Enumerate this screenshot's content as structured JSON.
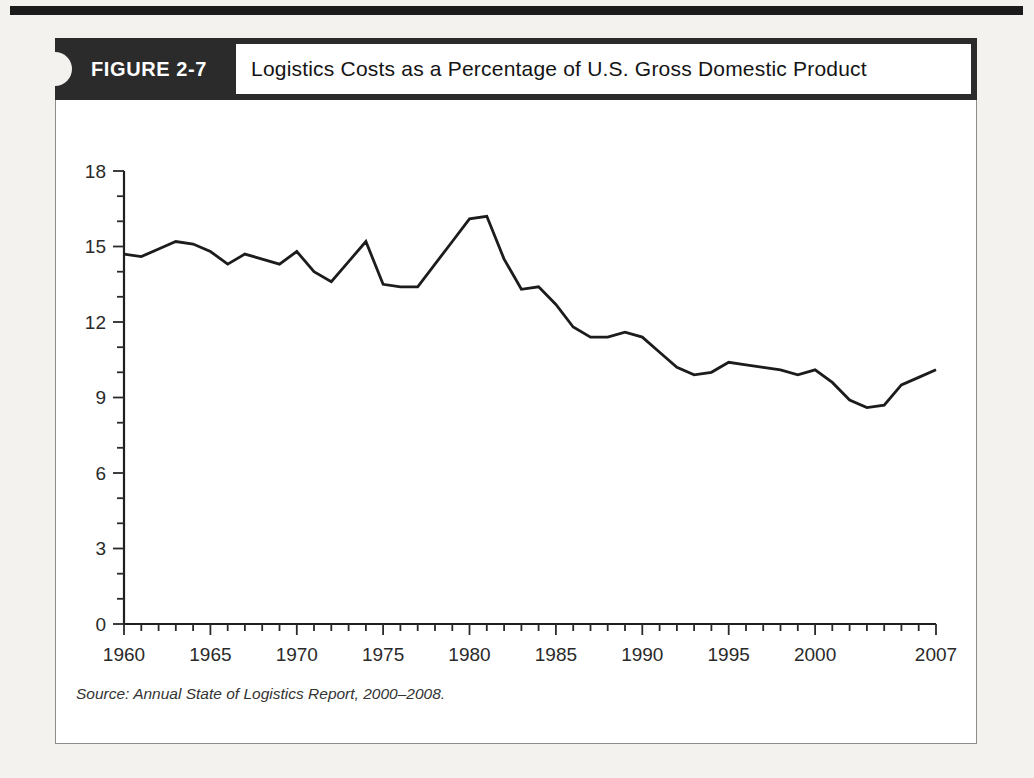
{
  "header": {
    "figure_label": "FIGURE 2-7",
    "title": "Logistics Costs as a Percentage of U.S. Gross Domestic Product"
  },
  "footer": {
    "source": "Source: Annual State of Logistics Report, 2000–2008."
  },
  "colors": {
    "ink": "#1f1f1f",
    "tick": "#2a2a2a",
    "label": "#2a2a2a",
    "line": "#1c1c1c",
    "header_band": "#2b2b2b",
    "page_background": "#f3f2ef"
  },
  "chart_data": {
    "type": "line",
    "title": "Logistics Costs as a Percentage of U.S. Gross Domestic Product",
    "xlabel": "",
    "ylabel": "",
    "xlim": [
      1960,
      2007
    ],
    "ylim": [
      0,
      18
    ],
    "grid": false,
    "legend": null,
    "y_major_ticks": [
      0,
      3,
      6,
      9,
      12,
      15,
      18
    ],
    "y_tick_labels": [
      "0",
      "3",
      "6",
      "9",
      "12",
      "15",
      "18"
    ],
    "y_minor_step": 1,
    "x_minor_step": 1,
    "x_major_tick_years": [
      1960,
      1965,
      1970,
      1975,
      1980,
      1985,
      1990,
      1995,
      2000,
      2007
    ],
    "x_tick_labels": [
      "1960",
      "1965",
      "1970",
      "1975",
      "1980",
      "1985",
      "1990",
      "1995",
      "2000",
      "2007"
    ],
    "x": [
      1960,
      1961,
      1962,
      1963,
      1964,
      1965,
      1966,
      1967,
      1968,
      1969,
      1970,
      1971,
      1972,
      1973,
      1974,
      1975,
      1976,
      1977,
      1978,
      1979,
      1980,
      1981,
      1982,
      1983,
      1984,
      1985,
      1986,
      1987,
      1988,
      1989,
      1990,
      1991,
      1992,
      1993,
      1994,
      1995,
      1996,
      1997,
      1998,
      1999,
      2000,
      2001,
      2002,
      2003,
      2004,
      2005,
      2006,
      2007
    ],
    "values": [
      14.7,
      14.6,
      14.9,
      15.2,
      15.1,
      14.8,
      14.3,
      14.7,
      14.5,
      14.3,
      14.8,
      14.0,
      13.6,
      14.4,
      15.2,
      13.5,
      13.4,
      13.4,
      14.3,
      15.2,
      16.1,
      16.2,
      14.5,
      13.3,
      13.4,
      12.7,
      11.8,
      11.4,
      11.4,
      11.6,
      11.4,
      10.8,
      10.2,
      9.9,
      10.0,
      10.4,
      10.3,
      10.2,
      10.1,
      9.9,
      10.1,
      9.6,
      8.9,
      8.6,
      8.7,
      9.5,
      9.8,
      10.1
    ]
  }
}
